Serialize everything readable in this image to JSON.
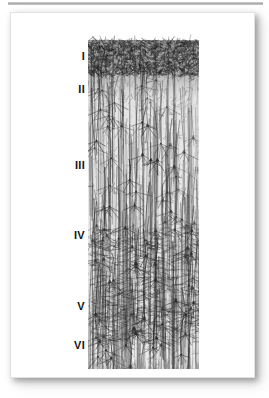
{
  "figure": {
    "kind": "histology-plate",
    "description": "Golgi-stained vertical section of cerebral cortex showing six cortical layers",
    "specimen": {
      "name": "cortical-column",
      "top_band_label": "dense molecular layer",
      "neuron_type": "pyramidal neurons with apical dendrites"
    },
    "layers": [
      {
        "id": "I",
        "label": "I",
        "top": 38,
        "band_top": 12,
        "band_bottom": 48,
        "density": 0.95
      },
      {
        "id": "II",
        "label": "II",
        "top": 71,
        "band_top": 48,
        "band_bottom": 90,
        "density": 0.72
      },
      {
        "id": "III",
        "label": "III",
        "top": 147,
        "band_top": 90,
        "band_bottom": 200,
        "density": 0.55
      },
      {
        "id": "IV",
        "label": "IV",
        "top": 217,
        "band_top": 200,
        "band_bottom": 262,
        "density": 0.6
      },
      {
        "id": "V",
        "label": "V",
        "top": 288,
        "band_top": 262,
        "band_bottom": 316,
        "density": 0.74
      },
      {
        "id": "VI",
        "label": "VI",
        "top": 327,
        "band_top": 316,
        "band_bottom": 356,
        "density": 0.5
      }
    ],
    "colors": {
      "page_background": "#ffffff",
      "card_background": "#ffffff",
      "card_border": "#e3e3e3",
      "rule": "#a9a9a9",
      "label_text": "#141414",
      "stain_dark": "#2b2b2b",
      "stain_mid": "#5e5e5e",
      "stain_light": "#9a9a9a"
    }
  }
}
